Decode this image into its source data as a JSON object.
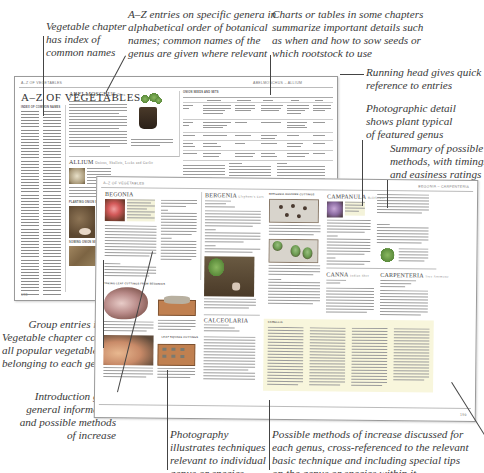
{
  "callouts": {
    "vegetable_index": "Vegetable chapter\nhas index of\ncommon names",
    "az_entries": "A–Z entries on specific genera in\nalphabetical order of botanical\nnames; common names of the\ngenus are given where relevant",
    "charts_tables": "Charts or tables in some chapters\nsummarize important details such\nas when and how to sow seeds or\nwhich rootstock to use",
    "running_head": "Running head gives quick\nreference to entries",
    "photographic_detail": "Photographic detail\nshows plant typical\nof featured genus",
    "summary_methods": "Summary of possible\nmethods, with timings\nand easiness ratings",
    "group_entries": "Group entries in\nVegetable chapter cover\nall popular vegetables\nbelonging to each genus",
    "introduction": "Introduction gives\ngeneral information\nand possible methods\nof increase",
    "photography": "Photography\nillustrates techniques\nrelevant to individual\ngenus or species",
    "possible_methods": "Possible methods of increase discussed for\neach genus, cross-referenced to the relevant\nbasic technique and including special tips\non the genus or species within it"
  },
  "back_page": {
    "running_head_left": "A–Z OF VEGETABLES",
    "running_head_right": "ABELMOSCHUS – ALLIUM",
    "title": "A–Z OF VEGETABLES",
    "index_heading": "INDEX OF COMMON NAMES",
    "entries": [
      {
        "genus": "ABELMOSCHUS",
        "common": "Okra"
      },
      {
        "genus": "ALLIUM",
        "common": "Onions, Shallots, Leeks and Garlic"
      }
    ],
    "chart_title": "ONION SEEDS AND SETS",
    "chart_columns": [
      "",
      "Bulb onions",
      "Shallot onions",
      "Bunching",
      "Leeks",
      "Welsh"
    ],
    "subsections": [
      "PLANTING ONION SETS",
      "SOWING ONION SEEDS"
    ]
  },
  "front_page": {
    "running_head_left": "A–Z OF VEGETABLES",
    "running_head_right": "BEGONIA – CARPENTERIA",
    "entries": [
      {
        "genus": "BEGONIA",
        "common": ""
      },
      {
        "genus": "BERGENIA",
        "common": "Elephant's Ears"
      },
      {
        "genus": "CAMPANULA",
        "common": "Bellflower"
      },
      {
        "genus": "CALCEOLARIA",
        "common": "Slipper Flower"
      },
      {
        "genus": "CANNA",
        "common": "Indian Shot"
      },
      {
        "genus": "CARPENTERIA",
        "common": "Tree Anemone"
      }
    ],
    "photo_sections": [
      "TAKING LEAF CUTTINGS FROM BEGONIAS",
      "LEAF SQUARE CUTTINGS",
      "BERGENIA RHIZOME CUTTINGS"
    ],
    "boxed_heading": "CAMELLIA",
    "page_number": "199"
  }
}
